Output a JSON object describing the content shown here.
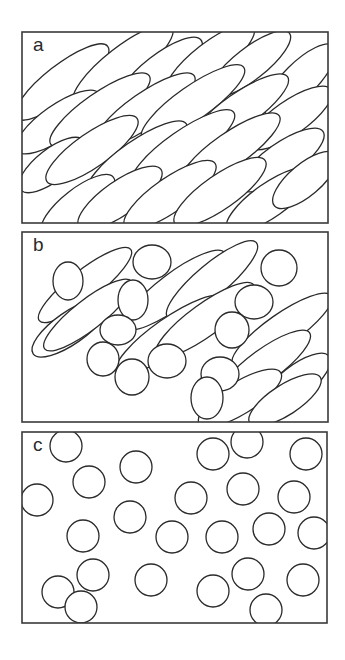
{
  "figure": {
    "panels": [
      {
        "id": "a",
        "label": "a",
        "description": "Densely packed elongated grains with strong preferred orientation",
        "frame": {
          "x": 22,
          "y": 32,
          "w": 306,
          "h": 191
        },
        "grains": [
          {
            "cx": 62,
            "cy": 82,
            "rx": 58,
            "ry": 17,
            "rot": -38
          },
          {
            "cx": 123,
            "cy": 65,
            "rx": 62,
            "ry": 18,
            "rot": -38
          },
          {
            "cx": 160,
            "cy": 72,
            "rx": 52,
            "ry": 17,
            "rot": -38
          },
          {
            "cx": 210,
            "cy": 60,
            "rx": 55,
            "ry": 17,
            "rot": -38
          },
          {
            "cx": 250,
            "cy": 64,
            "rx": 50,
            "ry": 16,
            "rot": -38
          },
          {
            "cx": 300,
            "cy": 80,
            "rx": 48,
            "ry": 17,
            "rot": -45
          },
          {
            "cx": 58,
            "cy": 122,
            "rx": 50,
            "ry": 17,
            "rot": -35
          },
          {
            "cx": 100,
            "cy": 110,
            "rx": 60,
            "ry": 17,
            "rot": -35
          },
          {
            "cx": 145,
            "cy": 110,
            "rx": 60,
            "ry": 17,
            "rot": -35
          },
          {
            "cx": 193,
            "cy": 103,
            "rx": 62,
            "ry": 17,
            "rot": -35
          },
          {
            "cx": 240,
            "cy": 110,
            "rx": 58,
            "ry": 17,
            "rot": -35
          },
          {
            "cx": 290,
            "cy": 118,
            "rx": 50,
            "ry": 17,
            "rot": -35
          },
          {
            "cx": 52,
            "cy": 165,
            "rx": 40,
            "ry": 16,
            "rot": -38
          },
          {
            "cx": 92,
            "cy": 150,
            "rx": 55,
            "ry": 17,
            "rot": -35
          },
          {
            "cx": 137,
            "cy": 158,
            "rx": 60,
            "ry": 17,
            "rot": -35
          },
          {
            "cx": 183,
            "cy": 148,
            "rx": 62,
            "ry": 17,
            "rot": -35
          },
          {
            "cx": 230,
            "cy": 150,
            "rx": 60,
            "ry": 17,
            "rot": -35
          },
          {
            "cx": 282,
            "cy": 160,
            "rx": 50,
            "ry": 17,
            "rot": -35
          },
          {
            "cx": 78,
            "cy": 205,
            "rx": 45,
            "ry": 16,
            "rot": -38
          },
          {
            "cx": 120,
            "cy": 198,
            "rx": 50,
            "ry": 17,
            "rot": -35
          },
          {
            "cx": 170,
            "cy": 195,
            "rx": 55,
            "ry": 17,
            "rot": -35
          },
          {
            "cx": 220,
            "cy": 192,
            "rx": 55,
            "ry": 17,
            "rot": -35
          },
          {
            "cx": 270,
            "cy": 200,
            "rx": 52,
            "ry": 17,
            "rot": -35
          },
          {
            "cx": 305,
            "cy": 180,
            "rx": 40,
            "ry": 16,
            "rot": -40
          }
        ]
      },
      {
        "id": "b",
        "label": "b",
        "description": "Mixed elongated grains and rounded grains",
        "frame": {
          "x": 22,
          "y": 232,
          "w": 306,
          "h": 190
        },
        "grains": [
          {
            "cx": 85,
            "cy": 285,
            "rx": 58,
            "ry": 15,
            "rot": -38
          },
          {
            "cx": 70,
            "cy": 328,
            "rx": 45,
            "ry": 16,
            "rot": -35
          },
          {
            "cx": 88,
            "cy": 315,
            "rx": 55,
            "ry": 15,
            "rot": -38
          },
          {
            "cx": 175,
            "cy": 290,
            "rx": 62,
            "ry": 17,
            "rot": -37
          },
          {
            "cx": 212,
            "cy": 280,
            "rx": 58,
            "ry": 16,
            "rot": -40
          },
          {
            "cx": 170,
            "cy": 335,
            "rx": 65,
            "ry": 17,
            "rot": -35
          },
          {
            "cx": 205,
            "cy": 320,
            "rx": 60,
            "ry": 16,
            "rot": -36
          },
          {
            "cx": 282,
            "cy": 330,
            "rx": 60,
            "ry": 16,
            "rot": -35
          },
          {
            "cx": 265,
            "cy": 365,
            "rx": 55,
            "ry": 16,
            "rot": -36
          },
          {
            "cx": 296,
            "cy": 382,
            "rx": 42,
            "ry": 16,
            "rot": -38
          },
          {
            "cx": 240,
            "cy": 398,
            "rx": 48,
            "ry": 16,
            "rot": -32
          },
          {
            "cx": 285,
            "cy": 400,
            "rx": 42,
            "ry": 15,
            "rot": -33
          }
        ],
        "round_grains": [
          {
            "cx": 68,
            "cy": 281,
            "rx": 15,
            "ry": 19
          },
          {
            "cx": 152,
            "cy": 262,
            "rx": 19,
            "ry": 17
          },
          {
            "cx": 133,
            "cy": 300,
            "rx": 15,
            "ry": 20
          },
          {
            "cx": 118,
            "cy": 330,
            "rx": 18,
            "ry": 15
          },
          {
            "cx": 103,
            "cy": 359,
            "rx": 16,
            "ry": 17
          },
          {
            "cx": 132,
            "cy": 377,
            "rx": 17,
            "ry": 18
          },
          {
            "cx": 167,
            "cy": 361,
            "rx": 19,
            "ry": 17
          },
          {
            "cx": 279,
            "cy": 268,
            "rx": 18,
            "ry": 18
          },
          {
            "cx": 254,
            "cy": 302,
            "rx": 19,
            "ry": 17
          },
          {
            "cx": 232,
            "cy": 330,
            "rx": 17,
            "ry": 18
          },
          {
            "cx": 220,
            "cy": 374,
            "rx": 19,
            "ry": 17
          },
          {
            "cx": 207,
            "cy": 398,
            "rx": 16,
            "ry": 21
          }
        ]
      },
      {
        "id": "c",
        "label": "c",
        "description": "Sparse, randomly distributed round grains",
        "frame": {
          "x": 22,
          "y": 432,
          "w": 305,
          "h": 191
        },
        "circles": [
          {
            "cx": 66,
            "cy": 446,
            "r": 16
          },
          {
            "cx": 136,
            "cy": 467,
            "r": 16
          },
          {
            "cx": 89,
            "cy": 482,
            "r": 16
          },
          {
            "cx": 37,
            "cy": 500,
            "r": 16
          },
          {
            "cx": 130,
            "cy": 517,
            "r": 16
          },
          {
            "cx": 83,
            "cy": 536,
            "r": 16
          },
          {
            "cx": 172,
            "cy": 537,
            "r": 16
          },
          {
            "cx": 93,
            "cy": 575,
            "r": 16
          },
          {
            "cx": 58,
            "cy": 592,
            "r": 16
          },
          {
            "cx": 81,
            "cy": 607,
            "r": 16
          },
          {
            "cx": 151,
            "cy": 580,
            "r": 16
          },
          {
            "cx": 191,
            "cy": 498,
            "r": 16
          },
          {
            "cx": 213,
            "cy": 454,
            "r": 16
          },
          {
            "cx": 247,
            "cy": 442,
            "r": 16
          },
          {
            "cx": 243,
            "cy": 489,
            "r": 16
          },
          {
            "cx": 222,
            "cy": 537,
            "r": 16
          },
          {
            "cx": 213,
            "cy": 591,
            "r": 16
          },
          {
            "cx": 248,
            "cy": 574,
            "r": 16
          },
          {
            "cx": 306,
            "cy": 454,
            "r": 16
          },
          {
            "cx": 294,
            "cy": 497,
            "r": 16
          },
          {
            "cx": 269,
            "cy": 529,
            "r": 16
          },
          {
            "cx": 314,
            "cy": 533,
            "r": 16
          },
          {
            "cx": 303,
            "cy": 580,
            "r": 16
          },
          {
            "cx": 266,
            "cy": 610,
            "r": 16
          }
        ]
      }
    ]
  }
}
